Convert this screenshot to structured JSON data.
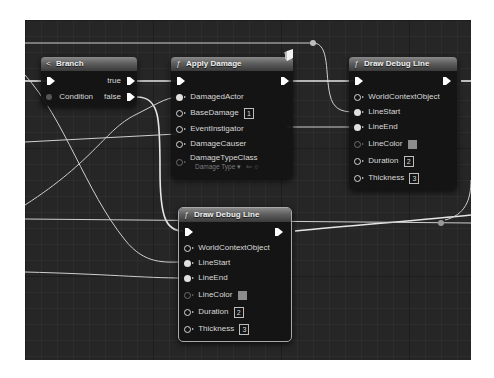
{
  "app": "Blueprint Event Graph",
  "nodes": {
    "branch": {
      "title": "Branch",
      "icon": "branch-icon",
      "outputs": {
        "true_label": "true",
        "false_label": "false"
      },
      "inputs": {
        "condition_label": "Condition"
      }
    },
    "apply_damage": {
      "title": "Apply Damage",
      "icon": "function-icon",
      "badge_icon": "server-cube-icon",
      "inputs": {
        "damaged_actor": "DamagedActor",
        "base_damage": "BaseDamage",
        "base_damage_value": "1",
        "event_instigator": "EventInstigator",
        "damage_causer": "DamageCauser",
        "damage_type_class": "DamageTypeClass",
        "damage_type_value": "Damage Type ▾"
      }
    },
    "draw_debug_line_top": {
      "title": "Draw Debug Line",
      "icon": "function-icon",
      "inputs": {
        "world_context": "WorldContextObject",
        "line_start": "LineStart",
        "line_end": "LineEnd",
        "line_color": "LineColor",
        "line_color_hex": "#8c8c8c",
        "duration": "Duration",
        "duration_value": "2",
        "thickness": "Thickness",
        "thickness_value": "3"
      }
    },
    "draw_debug_line_bottom": {
      "title": "Draw Debug Line",
      "icon": "function-icon",
      "selected": true,
      "inputs": {
        "world_context": "WorldContextObject",
        "line_start": "LineStart",
        "line_end": "LineEnd",
        "line_color": "LineColor",
        "line_color_hex": "#8c8c8c",
        "duration": "Duration",
        "duration_value": "2",
        "thickness": "Thickness",
        "thickness_value": "3"
      }
    }
  },
  "colors": {
    "canvas_bg": "#262626",
    "node_bg": "#121212",
    "wire": "#d0d0d0",
    "selection_border": "#a9a9a9"
  }
}
